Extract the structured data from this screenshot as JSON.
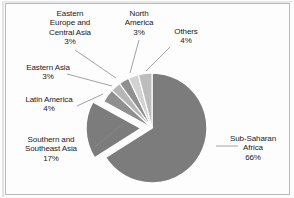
{
  "figure": {
    "background_color": "#fdfdfd",
    "border_color": "#b9b9b9",
    "text_color": "#1a1a1a",
    "leader_line_color": "#8a8a8a",
    "slice_outline_color": "#ffffff"
  },
  "chart_data": {
    "type": "pie",
    "title": "",
    "subtitle": "",
    "xlabel": "",
    "ylabel": "",
    "legend_position": "none",
    "grid": false,
    "labels_outside": true,
    "start_angle_deg": -90,
    "direction": "clockwise",
    "categories": [
      "Sub-Saharan Africa",
      "Southern and Southeast Asia",
      "Latin America",
      "Eastern Asia",
      "Eastern Europe and Central Asia",
      "North America",
      "Others"
    ],
    "values": [
      66,
      17,
      4,
      3,
      3,
      3,
      4
    ],
    "unit": "%",
    "slices": [
      {
        "name": "Sub-Saharan Africa",
        "label_line1": "Sub-Saharan",
        "label_line2": "Africa",
        "value": 66,
        "value_label": "66%",
        "color": "#7c7c7c",
        "exploded": false
      },
      {
        "name": "Southern and Southeast Asia",
        "label_line1": "Southern and",
        "label_line2": "Southeast Asia",
        "value": 17,
        "value_label": "17%",
        "color": "#7c7c7c",
        "exploded": true
      },
      {
        "name": "Latin America",
        "label_line1": "Latin America",
        "label_line2": "",
        "value": 4,
        "value_label": "4%",
        "color": "#8f8f8f",
        "exploded": false
      },
      {
        "name": "Eastern Asia",
        "label_line1": "Eastern Asia",
        "label_line2": "",
        "value": 3,
        "value_label": "3%",
        "color": "#b6b6b6",
        "exploded": false
      },
      {
        "name": "Eastern Europe and Central Asia",
        "label_line1": "Eastern",
        "label_line2": "Europe and",
        "label_line3": "Central Asia",
        "value": 3,
        "value_label": "3%",
        "color": "#8f8f8f",
        "exploded": false
      },
      {
        "name": "North America",
        "label_line1": "North",
        "label_line2": "America",
        "value": 3,
        "value_label": "3%",
        "color": "#d2d2d2",
        "exploded": false
      },
      {
        "name": "Others",
        "label_line1": "Others",
        "label_line2": "",
        "value": 4,
        "value_label": "4%",
        "color": "#bdbdbd",
        "exploded": false
      }
    ]
  }
}
